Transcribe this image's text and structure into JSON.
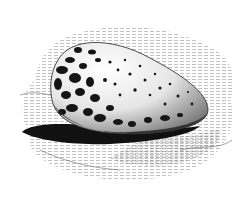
{
  "image": {
    "subject": "speckled egg resting on rock",
    "style": "black and white engraving illustration",
    "colors": {
      "ink": "#111111",
      "paper": "#ffffff",
      "hatch": "#6a6a6a"
    }
  }
}
